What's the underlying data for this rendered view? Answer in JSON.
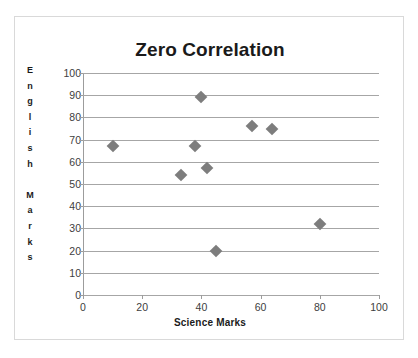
{
  "chart_data": {
    "type": "scatter",
    "title": "Zero Correlation",
    "xlabel": "Science  Marks",
    "ylabel": "English Marks",
    "ylabel_letters": [
      "E",
      "n",
      "g",
      "l",
      "i",
      "s",
      "h",
      "",
      "M",
      "a",
      "r",
      "k",
      "s"
    ],
    "xlim": [
      0,
      100
    ],
    "ylim": [
      0,
      100
    ],
    "xticks": [
      0,
      20,
      40,
      60,
      80,
      100
    ],
    "yticks": [
      0,
      10,
      20,
      30,
      40,
      50,
      60,
      70,
      80,
      90,
      100
    ],
    "grid": "horizontal",
    "legend": "none",
    "marker": "diamond",
    "marker_color": "#7d7d7d",
    "gridline_color": "#a6a6a6",
    "points": [
      {
        "x": 10,
        "y": 67
      },
      {
        "x": 33,
        "y": 54
      },
      {
        "x": 38,
        "y": 67
      },
      {
        "x": 40,
        "y": 89
      },
      {
        "x": 42,
        "y": 57
      },
      {
        "x": 45,
        "y": 20
      },
      {
        "x": 57,
        "y": 76
      },
      {
        "x": 64,
        "y": 75
      },
      {
        "x": 80,
        "y": 32
      }
    ]
  }
}
